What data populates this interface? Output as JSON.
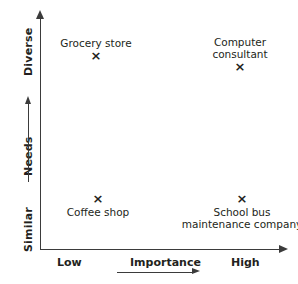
{
  "chart_data": {
    "type": "scatter",
    "title": "",
    "xlabel": "Importance",
    "ylabel": "Needs",
    "xlim": [
      0,
      1
    ],
    "ylim": [
      0,
      1
    ],
    "grid": false,
    "legend": null,
    "x_tick_labels": [
      "Low",
      "High"
    ],
    "y_tick_labels": [
      "Similar",
      "Diverse"
    ],
    "x_axis_direction_arrow": true,
    "y_axis_direction_arrow": true,
    "marker_glyph": "×",
    "points": [
      {
        "label": "Grocery store",
        "label_lines": [
          "Grocery store"
        ],
        "x_category": "Low",
        "y_category": "Diverse",
        "x": 0.23,
        "y": 0.79,
        "label_position": "above"
      },
      {
        "label": "Computer consultant",
        "label_lines": [
          "Computer",
          "consultant"
        ],
        "x_category": "High",
        "y_category": "Diverse",
        "x": 0.82,
        "y": 0.72,
        "label_position": "above"
      },
      {
        "label": "Coffee shop",
        "label_lines": [
          "Coffee shop"
        ],
        "x_category": "Low",
        "y_category": "Similar",
        "x": 0.24,
        "y": 0.2,
        "label_position": "below"
      },
      {
        "label": "School bus maintenance company",
        "label_lines": [
          "School bus",
          "maintenance company"
        ],
        "x_category": "High",
        "y_category": "Similar",
        "x": 0.84,
        "y": 0.2,
        "label_position": "below"
      }
    ]
  },
  "axes": {
    "y": {
      "top_label": "Diverse",
      "mid_label": "Needs",
      "bottom_label": "Similar"
    },
    "x": {
      "left_label": "Low",
      "mid_label": "Importance",
      "right_label": "High"
    }
  },
  "colors": {
    "ink": "#231f20",
    "axis": "#3b3b3b",
    "background": "#ffffff"
  }
}
